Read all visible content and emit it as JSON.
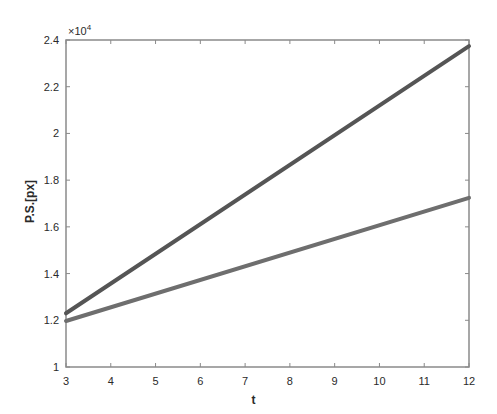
{
  "chart_data": {
    "type": "line",
    "title": "",
    "xlabel": "t",
    "ylabel": "P.S.[px]",
    "y_exponent_label": "×10",
    "y_exponent_power": "4",
    "xlim": [
      3,
      12
    ],
    "ylim": [
      10000,
      24000
    ],
    "x_ticks": [
      3,
      4,
      5,
      6,
      7,
      8,
      9,
      10,
      11,
      12
    ],
    "x_tick_labels": [
      "3",
      "4",
      "5",
      "6",
      "7",
      "8",
      "9",
      "10",
      "11",
      "12"
    ],
    "y_ticks": [
      10000,
      12000,
      14000,
      16000,
      18000,
      20000,
      22000,
      24000
    ],
    "y_tick_labels": [
      "1",
      "1.2",
      "1.4",
      "1.6",
      "1.8",
      "2",
      "2.2",
      "2.4"
    ],
    "grid": false,
    "legend": null,
    "series": [
      {
        "name": "upper line",
        "x": [
          3,
          12
        ],
        "values": [
          12300,
          23740
        ],
        "color": "#555555"
      },
      {
        "name": "lower line",
        "x": [
          3,
          12
        ],
        "values": [
          11970,
          17240
        ],
        "color": "#6e6e6e"
      }
    ]
  }
}
